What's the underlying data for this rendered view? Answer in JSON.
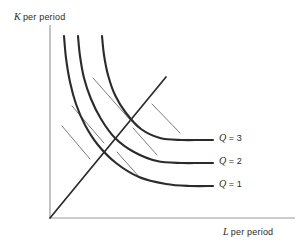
{
  "figure": {
    "background_color": "#ffffff",
    "line_color": "#2b2b2b",
    "axis_color": "#9a9a9a"
  },
  "axes": {
    "y": {
      "variable": "K",
      "suffix": "per period"
    },
    "x": {
      "variable": "L",
      "suffix": "per period"
    }
  },
  "isoquants": [
    {
      "id": "q3",
      "variable": "Q",
      "equals": "=",
      "value": "3"
    },
    {
      "id": "q2",
      "variable": "Q",
      "equals": "=",
      "value": "2"
    },
    {
      "id": "q1",
      "variable": "Q",
      "equals": "=",
      "value": "1"
    }
  ],
  "chart_data": {
    "type": "line",
    "title": "",
    "xlabel": "L per period",
    "ylabel": "K per period",
    "grid": false,
    "legend_position": "right-inline",
    "axis_origin_px": [
      50,
      218
    ],
    "axis_extent_px": {
      "x_end": 295,
      "y_top": 25
    },
    "series": [
      {
        "name": "Q = 1",
        "label": "Q = 1",
        "points_px": [
          [
            64,
            36
          ],
          [
            66,
            58
          ],
          [
            70,
            82
          ],
          [
            76,
            104
          ],
          [
            85,
            125
          ],
          [
            98,
            145
          ],
          [
            116,
            163
          ],
          [
            139,
            177
          ],
          [
            166,
            184
          ],
          [
            190,
            186
          ],
          [
            213,
            186
          ]
        ],
        "asymptote_y_px": 186,
        "label_px": [
          219,
          178
        ]
      },
      {
        "name": "Q = 2",
        "label": "Q = 2",
        "points_px": [
          [
            78,
            36
          ],
          [
            80,
            56
          ],
          [
            84,
            78
          ],
          [
            91,
            99
          ],
          [
            101,
            119
          ],
          [
            115,
            138
          ],
          [
            134,
            152
          ],
          [
            157,
            161
          ],
          [
            182,
            163
          ],
          [
            200,
            163
          ],
          [
            213,
            163
          ]
        ],
        "asymptote_y_px": 163,
        "label_px": [
          219,
          155
        ]
      },
      {
        "name": "Q = 3",
        "label": "Q = 3",
        "points_px": [
          [
            102,
            36
          ],
          [
            104,
            55
          ],
          [
            108,
            75
          ],
          [
            115,
            95
          ],
          [
            126,
            113
          ],
          [
            141,
            129
          ],
          [
            160,
            138
          ],
          [
            182,
            140
          ],
          [
            200,
            140
          ],
          [
            213,
            140
          ]
        ],
        "asymptote_y_px": 140,
        "label_px": [
          219,
          132
        ]
      }
    ],
    "expansion_ray": {
      "name": "ray-from-origin",
      "from_px": [
        50,
        218
      ],
      "to_px": [
        166,
        77
      ],
      "slope_description": "constant capital-labour ratio ray through origin"
    },
    "tangents": [
      {
        "name": "tangent-q1",
        "from_px": [
          62,
          126
        ],
        "to_px": [
          90,
          159
        ]
      },
      {
        "name": "tangent-q2",
        "from_px": [
          72,
          106
        ],
        "to_px": [
          104,
          143
        ]
      },
      {
        "name": "tangent-q3",
        "from_px": [
          93,
          78
        ],
        "to_px": [
          131,
          121
        ]
      },
      {
        "name": "tangent-q1-outer",
        "from_px": [
          117,
          152
        ],
        "to_px": [
          141,
          179
        ]
      },
      {
        "name": "tangent-q2-outer",
        "from_px": [
          133,
          128
        ],
        "to_px": [
          157,
          155
        ]
      },
      {
        "name": "tangent-q3-outer",
        "from_px": [
          152,
          104
        ],
        "to_px": [
          180,
          133
        ]
      }
    ],
    "annotation": "Homothetic production function: isoquants Q=1, Q=2, Q=3 with equal marginal rates of technical substitution along a ray from the origin."
  }
}
